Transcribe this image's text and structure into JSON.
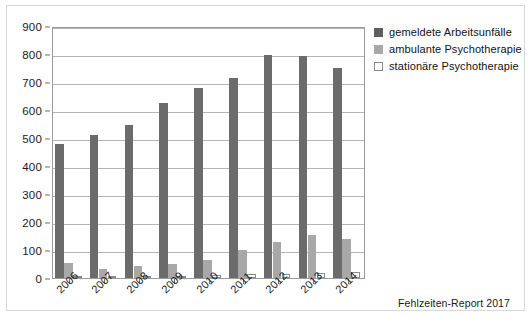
{
  "source_note": "Fehlzeiten-Report 2017",
  "chart_data": {
    "type": "bar",
    "title": "",
    "xlabel": "",
    "ylabel": "",
    "ylim": [
      0,
      900
    ],
    "ytick_step": 100,
    "yticks": [
      0,
      100,
      200,
      300,
      400,
      500,
      600,
      700,
      800,
      900
    ],
    "grid": true,
    "legend_position": "right",
    "categories": [
      "2006",
      "2007",
      "2008",
      "2009",
      "2010",
      "2011",
      "2012",
      "2013",
      "2014"
    ],
    "series": [
      {
        "name": "gemeldete Arbeitsunfälle",
        "color": "#6b6b6b",
        "values": [
          478,
          512,
          545,
          625,
          680,
          715,
          797,
          793,
          750
        ]
      },
      {
        "name": "ambulante Psychotherapie",
        "color": "#a8a8a8",
        "values": [
          55,
          33,
          42,
          50,
          65,
          100,
          130,
          152,
          138
        ]
      },
      {
        "name": "stationäre Psychotherapie",
        "color": "#ffffff",
        "values": [
          5,
          5,
          8,
          8,
          10,
          13,
          15,
          17,
          20
        ]
      }
    ]
  }
}
